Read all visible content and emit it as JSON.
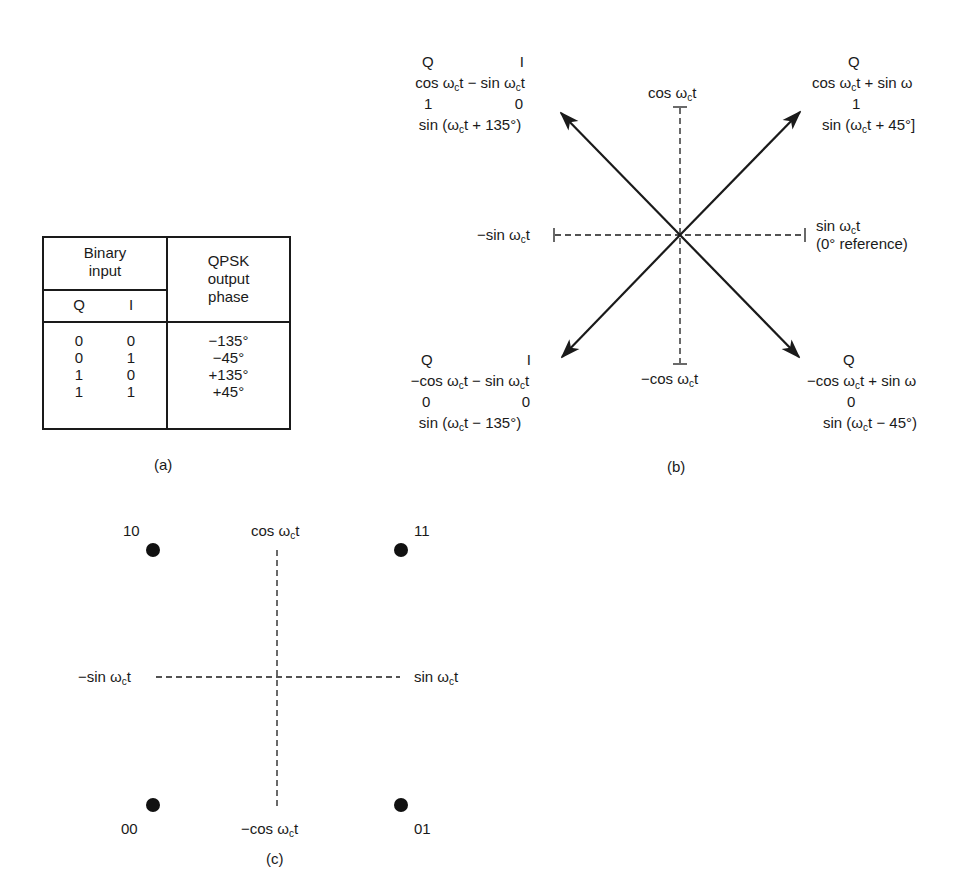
{
  "table_a": {
    "header_binary_input": [
      "Binary",
      "input"
    ],
    "header_q": "Q",
    "header_i": "I",
    "header_phase": [
      "QPSK",
      "output",
      "phase"
    ],
    "rows": [
      {
        "q": "0",
        "i": "0",
        "phase": "−135°"
      },
      {
        "q": "0",
        "i": "1",
        "phase": "−45°"
      },
      {
        "q": "1",
        "i": "0",
        "phase": "+135°"
      },
      {
        "q": "1",
        "i": "1",
        "phase": "+45°"
      }
    ],
    "caption": "(a)"
  },
  "phasor_b": {
    "axes": {
      "up": "cos ωct",
      "down": "−cos ωct",
      "left": "−sin ωct",
      "right_line1": "sin ωct",
      "right_line2": "(0° reference)"
    },
    "quadrants": {
      "nw": {
        "q_label": "Q",
        "i_label": "I",
        "expr": "cos ωct − sin ωct",
        "q": "1",
        "i": "0",
        "result": "sin (ωct + 135°)"
      },
      "ne": {
        "q_label": "Q",
        "i_label": "I",
        "expr": "cos ωct + sin ω",
        "q": "1",
        "i": "1",
        "result": "sin (ωct + 45°]"
      },
      "sw": {
        "q_label": "Q",
        "i_label": "I",
        "expr": "−cos ωct − sin ωct",
        "q": "0",
        "i": "0",
        "result": "sin (ωct − 135°)"
      },
      "se": {
        "q_label": "Q",
        "i_label": "I",
        "expr": "−cos ωct + sin ω",
        "q": "0",
        "i": "1",
        "result": "sin (ωct − 45°)"
      }
    },
    "caption": "(b)"
  },
  "constellation_c": {
    "axes": {
      "up": "cos ωct",
      "down": "−cos ωct",
      "left": "−sin ωct",
      "right": "sin ωct"
    },
    "points": [
      {
        "label": "10",
        "position": "top-left"
      },
      {
        "label": "11",
        "position": "top-right"
      },
      {
        "label": "00",
        "position": "bottom-left"
      },
      {
        "label": "01",
        "position": "bottom-right"
      }
    ],
    "caption": "(c)"
  },
  "colors": {
    "ink": "#1a1a1a",
    "background": "#ffffff"
  }
}
